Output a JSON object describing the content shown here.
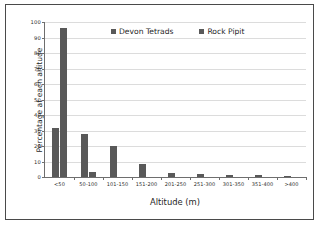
{
  "chart_data": {
    "type": "bar",
    "title": "",
    "xlabel": "Altitude (m)",
    "ylabel": "Percentage at each altitude",
    "categories": [
      "<50",
      "50-100",
      "101-150",
      "151-200",
      "201-250",
      "251-300",
      "301-350",
      "351-400",
      ">400"
    ],
    "series": [
      {
        "name": "Devon Tetrads",
        "color": "#595959",
        "values": [
          31.8,
          27.5,
          19.8,
          8.7,
          2.3,
          2.2,
          1.6,
          1.1,
          0.9
        ]
      },
      {
        "name": "Rock Pipit",
        "color": "#595959",
        "values": [
          96.2,
          3.0,
          0,
          0,
          0,
          0,
          0,
          0,
          0
        ]
      }
    ],
    "ylim": [
      0,
      100
    ],
    "ytick_labels": [
      "0",
      "10",
      "20",
      "30",
      "40",
      "50",
      "60",
      "70",
      "80",
      "90",
      "100"
    ],
    "ytick_values": [
      0,
      10,
      20,
      30,
      40,
      50,
      60,
      70,
      80,
      90,
      100
    ],
    "grid": true,
    "legend_position": "top-center"
  },
  "legend": {
    "items": [
      {
        "label": "Devon Tetrads"
      },
      {
        "label": "Rock Pipit"
      }
    ]
  },
  "axes": {
    "x_title": "Altitude (m)",
    "y_title": "Percentage at each altitude"
  }
}
